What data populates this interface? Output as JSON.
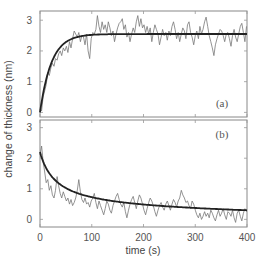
{
  "chart_data": {
    "type": "line",
    "ylabel": "change of thickness (nm)",
    "xlabel": "time (s)",
    "xlim": [
      0,
      400
    ],
    "xticks": [
      0,
      100,
      200,
      300,
      400
    ],
    "grid": false,
    "panels": [
      {
        "label": "(a)",
        "ylim": [
          -0.15,
          3.3
        ],
        "yticks": [
          0,
          1,
          2,
          3
        ],
        "fit": {
          "model": "exponential rise",
          "amplitude": 2.55,
          "tau": 22
        },
        "series": {
          "name": "measured",
          "x": [
            0,
            3,
            6,
            9,
            12,
            15,
            18,
            21,
            24,
            27,
            30,
            33,
            36,
            39,
            42,
            45,
            48,
            51,
            54,
            57,
            60,
            63,
            66,
            69,
            72,
            75,
            78,
            81,
            84,
            87,
            90,
            93,
            96,
            99,
            102,
            105,
            108,
            111,
            114,
            117,
            120,
            123,
            126,
            129,
            132,
            135,
            138,
            141,
            144,
            147,
            150,
            153,
            156,
            159,
            162,
            165,
            168,
            171,
            174,
            177,
            180,
            183,
            186,
            189,
            192,
            195,
            198,
            201,
            204,
            207,
            210,
            213,
            216,
            219,
            222,
            225,
            228,
            231,
            234,
            237,
            240,
            243,
            246,
            249,
            252,
            255,
            258,
            261,
            264,
            267,
            270,
            273,
            276,
            279,
            282,
            285,
            288,
            291,
            294,
            297,
            300,
            303,
            306,
            309,
            312,
            315,
            318,
            321,
            324,
            327,
            330,
            333,
            336,
            339,
            342,
            345,
            348,
            351,
            354,
            357,
            360,
            363,
            366,
            369,
            372,
            375,
            378,
            381,
            384,
            387,
            390,
            393,
            396,
            399
          ],
          "y": [
            0.1,
            0.05,
            0.5,
            0.7,
            0.9,
            1.3,
            1.2,
            1.45,
            1.6,
            1.5,
            1.75,
            1.7,
            1.9,
            2.0,
            1.85,
            2.1,
            2.0,
            2.15,
            1.95,
            2.3,
            2.1,
            2.4,
            2.65,
            2.55,
            2.45,
            2.6,
            2.3,
            2.5,
            2.45,
            2.2,
            2.55,
            2.0,
            1.75,
            2.4,
            2.6,
            2.55,
            2.7,
            3.15,
            2.8,
            2.6,
            2.95,
            2.7,
            2.85,
            2.6,
            2.95,
            2.75,
            2.5,
            2.65,
            2.3,
            2.55,
            2.75,
            2.9,
            2.95,
            3.05,
            2.7,
            2.85,
            2.45,
            2.6,
            2.3,
            2.55,
            2.75,
            2.6,
            2.95,
            3.15,
            2.8,
            3.05,
            2.75,
            2.85,
            2.6,
            2.8,
            2.55,
            2.75,
            2.3,
            2.6,
            2.85,
            2.7,
            2.55,
            2.2,
            2.45,
            2.7,
            2.5,
            2.6,
            2.35,
            2.65,
            2.5,
            2.8,
            2.95,
            2.7,
            2.4,
            2.6,
            2.3,
            2.55,
            2.75,
            2.65,
            2.4,
            2.85,
            2.95,
            2.6,
            2.45,
            2.2,
            2.5,
            2.65,
            2.4,
            2.8,
            2.55,
            2.7,
            2.95,
            3.1,
            2.8,
            2.5,
            2.3,
            2.1,
            1.85,
            2.2,
            2.4,
            2.55,
            2.7,
            2.65,
            2.5,
            2.3,
            2.55,
            2.6,
            2.4,
            2.15,
            2.5,
            2.7,
            2.45,
            2.3,
            2.55,
            2.8,
            2.9,
            2.6,
            2.3,
            2.8
          ]
        }
      },
      {
        "label": "(b)",
        "ylim": [
          -0.25,
          3.25
        ],
        "yticks": [
          0,
          1,
          2,
          3
        ],
        "fit": {
          "model": "decay",
          "start": 2.2,
          "end": 0.2
        },
        "series": {
          "name": "measured",
          "x": [
            0,
            3,
            6,
            9,
            12,
            15,
            18,
            21,
            24,
            27,
            30,
            33,
            36,
            39,
            42,
            45,
            48,
            51,
            54,
            57,
            60,
            63,
            66,
            69,
            72,
            75,
            78,
            81,
            84,
            87,
            90,
            93,
            96,
            99,
            102,
            105,
            108,
            111,
            114,
            117,
            120,
            123,
            126,
            129,
            132,
            135,
            138,
            141,
            144,
            147,
            150,
            153,
            156,
            159,
            162,
            165,
            168,
            171,
            174,
            177,
            180,
            183,
            186,
            189,
            192,
            195,
            198,
            201,
            204,
            207,
            210,
            213,
            216,
            219,
            222,
            225,
            228,
            231,
            234,
            237,
            240,
            243,
            246,
            249,
            252,
            255,
            258,
            261,
            264,
            267,
            270,
            273,
            276,
            279,
            282,
            285,
            288,
            291,
            294,
            297,
            300,
            303,
            306,
            309,
            312,
            315,
            318,
            321,
            324,
            327,
            330,
            333,
            336,
            339,
            342,
            345,
            348,
            351,
            354,
            357,
            360,
            363,
            366,
            369,
            372,
            375,
            378,
            381,
            384,
            387,
            390,
            393,
            396,
            399
          ],
          "y": [
            2.1,
            2.4,
            1.9,
            1.55,
            1.2,
            1.3,
            0.95,
            1.1,
            0.8,
            0.7,
            0.95,
            1.4,
            1.1,
            0.85,
            0.7,
            0.9,
            0.75,
            0.6,
            0.7,
            0.5,
            0.65,
            0.45,
            0.55,
            0.7,
            0.95,
            1.3,
            0.9,
            0.65,
            0.55,
            0.7,
            0.5,
            0.55,
            0.4,
            0.6,
            0.7,
            0.85,
            0.55,
            0.35,
            0.6,
            0.45,
            0.3,
            0.15,
            0.35,
            0.6,
            0.5,
            0.3,
            0.2,
            0.45,
            0.6,
            0.75,
            0.85,
            0.65,
            0.5,
            0.4,
            0.55,
            0.25,
            0.05,
            0.3,
            0.5,
            0.65,
            0.75,
            0.55,
            0.35,
            0.6,
            0.8,
            0.7,
            0.5,
            0.3,
            0.15,
            0.35,
            0.55,
            0.7,
            0.6,
            0.45,
            0.25,
            0.1,
            0.3,
            0.45,
            0.55,
            0.4,
            0.3,
            0.5,
            0.6,
            0.45,
            0.3,
            0.5,
            0.65,
            0.55,
            0.4,
            0.6,
            0.7,
            0.95,
            0.8,
            0.7,
            0.55,
            0.6,
            0.45,
            0.35,
            0.6,
            0.5,
            0.3,
            0.15,
            0.05,
            0.2,
            0.0,
            0.1,
            0.25,
            0.1,
            0.2,
            0.05,
            0.3,
            0.2,
            0.05,
            -0.05,
            0.15,
            0.3,
            0.1,
            0.2,
            0.35,
            0.15,
            0.0,
            0.25,
            0.2,
            0.1,
            0.3,
            0.05,
            -0.1,
            0.2,
            0.3,
            0.1,
            -0.05,
            0.2,
            0.35,
            0.25
          ]
        }
      }
    ]
  }
}
